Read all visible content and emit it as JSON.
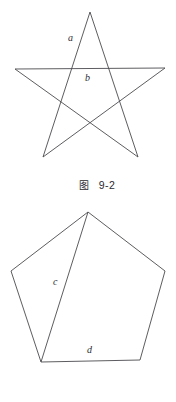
{
  "page": {
    "background": "#ffffff",
    "line_color": "#4b4b4f",
    "text_color": "#2b2b30",
    "width": 176,
    "height": 402
  },
  "figures": [
    {
      "id": "fig-9-2",
      "shape": "five-pointed-star-pentagram",
      "caption_tag": "图",
      "caption_number": "9-2",
      "caption_full": "图  9-2",
      "outline_points": "90,12 138,157 15,69 165,68 43,157 90,12",
      "labels": [
        {
          "name": "a",
          "text": "a",
          "x": 68,
          "y": 41
        },
        {
          "name": "b",
          "text": "b",
          "x": 85,
          "y": 81
        }
      ]
    },
    {
      "id": "fig-9-3",
      "shape": "pentagon-with-diagonal",
      "caption_tag": "图",
      "caption_number": "9-3",
      "caption_full": "图  9-3",
      "outline_points": "88,12 165,71 140,160 41,162 11,71 88,12",
      "diagonal_points": "88,12 41,162",
      "labels": [
        {
          "name": "c",
          "text": "c",
          "x": 53,
          "y": 85
        },
        {
          "name": "d",
          "text": "d",
          "x": 87,
          "y": 153
        }
      ]
    }
  ]
}
